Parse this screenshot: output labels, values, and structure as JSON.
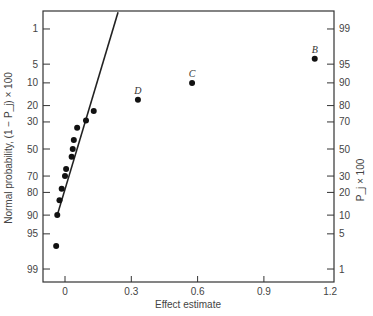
{
  "chart_data": {
    "type": "scatter",
    "title": "",
    "xlabel": "Effect estimate",
    "ylabel_left": "Normal probability, (1 − P_j) × 100",
    "ylabel_right": "P_j × 100",
    "xlim": [
      -0.08,
      1.2
    ],
    "x_ticks": [
      0,
      0.3,
      0.6,
      0.9,
      1.2
    ],
    "x_tick_labels": [
      "0",
      "0.3",
      "0.6",
      "0.9",
      "1.2"
    ],
    "y_left_ticks": [
      1,
      5,
      10,
      20,
      30,
      50,
      70,
      80,
      90,
      95,
      99
    ],
    "y_right_ticks": [
      99,
      95,
      90,
      80,
      70,
      50,
      30,
      20,
      10,
      5,
      1
    ],
    "grid": false,
    "series": [
      {
        "name": "effects",
        "points": [
          {
            "x": -0.04,
            "y": 97.0,
            "label": ""
          },
          {
            "x": -0.035,
            "y": 90.0,
            "label": ""
          },
          {
            "x": -0.025,
            "y": 84.0,
            "label": ""
          },
          {
            "x": -0.015,
            "y": 78.0,
            "label": ""
          },
          {
            "x": 0.0,
            "y": 70.0,
            "label": ""
          },
          {
            "x": 0.005,
            "y": 65.0,
            "label": ""
          },
          {
            "x": 0.03,
            "y": 56.0,
            "label": ""
          },
          {
            "x": 0.035,
            "y": 50.0,
            "label": ""
          },
          {
            "x": 0.04,
            "y": 43.0,
            "label": ""
          },
          {
            "x": 0.055,
            "y": 34.0,
            "label": ""
          },
          {
            "x": 0.095,
            "y": 29.0,
            "label": ""
          },
          {
            "x": 0.13,
            "y": 23.0,
            "label": ""
          },
          {
            "x": 0.33,
            "y": 17.0,
            "label": "D"
          },
          {
            "x": 0.575,
            "y": 10.0,
            "label": "C"
          },
          {
            "x": 1.13,
            "y": 4.0,
            "label": "B"
          }
        ]
      }
    ],
    "reference_line": {
      "from": {
        "x": -0.035,
        "y": 90.0
      },
      "to": {
        "x": 0.24,
        "y": 0.4
      }
    }
  }
}
